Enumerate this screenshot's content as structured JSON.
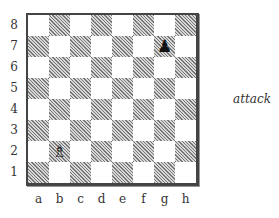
{
  "diagram": {
    "caption": "attack",
    "ranks": [
      "8",
      "7",
      "6",
      "5",
      "4",
      "3",
      "2",
      "1"
    ],
    "files": [
      "a",
      "b",
      "c",
      "d",
      "e",
      "f",
      "g",
      "h"
    ],
    "colors": {
      "dark_square_hatch": "#777777",
      "light_square": "#ffffff",
      "border": "#444444"
    },
    "pieces": [
      {
        "square": "g7",
        "piece": "pawn",
        "color": "black",
        "glyph": "♟"
      },
      {
        "square": "b2",
        "piece": "bishop",
        "color": "white",
        "glyph": "♗"
      }
    ]
  }
}
